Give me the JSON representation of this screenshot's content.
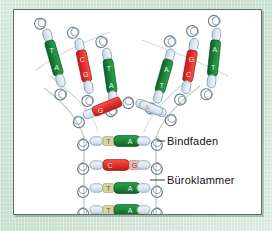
{
  "figure": {
    "panel_background": "#ffffff",
    "page_background": "#cfe3d6",
    "border_color": "#5d6f66"
  },
  "palette": {
    "base_green": "#1d8a3c",
    "base_green_dark": "#13682c",
    "base_red": "#e8322a",
    "base_red_dark": "#c2211b",
    "clip_fill": "#dbe9f2",
    "clip_stroke": "#6b7f8c",
    "string": "#b9c4bd",
    "letter_light": "#eaf4ea",
    "letter_tan": "#d8d2a0",
    "leader_line": "#3b3b3b",
    "label_text": "#111111"
  },
  "labels": [
    {
      "id": "bindfaden",
      "text": "Bindfaden",
      "x": 153,
      "y": 125
    },
    {
      "id": "bueroklammer",
      "text": "Büroklammer",
      "x": 153,
      "y": 164
    }
  ],
  "legend_leaders": [
    {
      "for": "bindfaden",
      "x1": 142,
      "y1": 131,
      "x2": 150,
      "y2": 131
    },
    {
      "for": "bueroklammer",
      "x1": 135,
      "y1": 170,
      "x2": 150,
      "y2": 170
    }
  ],
  "base_pair_letters": {
    "green_pair": [
      "T",
      "A"
    ],
    "red_pair": [
      "C",
      "G"
    ]
  },
  "ladder_rungs": [
    {
      "index": 1,
      "color": "green",
      "left_letter": "T",
      "right_letter": "A",
      "x": 70,
      "y": 131,
      "width": 72
    },
    {
      "index": 2,
      "color": "red",
      "left_letter": "C",
      "right_letter": "G",
      "x": 70,
      "y": 155,
      "width": 72
    },
    {
      "index": 3,
      "color": "green",
      "left_letter": "T",
      "right_letter": "A",
      "x": 70,
      "y": 178,
      "width": 72
    },
    {
      "index": 4,
      "color": "green",
      "left_letter": "T",
      "right_letter": "A",
      "x": 70,
      "y": 200,
      "width": 72
    }
  ],
  "fork": {
    "description": "Replikationsgabel - die Doppelhelix ist oben in zwei Einzelstraenge aufgetrennt",
    "left_strand_bases": [
      {
        "order": 1,
        "color": "green",
        "letters": [
          "T",
          "A"
        ],
        "cx": 40,
        "cy": 48,
        "angle": -14
      },
      {
        "order": 2,
        "color": "red",
        "letters": [
          "C",
          "G"
        ],
        "cx": 68,
        "cy": 55,
        "angle": -8
      },
      {
        "order": 3,
        "color": "green",
        "letters": [
          "T",
          "A"
        ],
        "cx": 93,
        "cy": 62,
        "angle": -6
      },
      {
        "order": 4,
        "color": "red",
        "letters": [
          "C",
          "G"
        ],
        "cx": 96,
        "cy": 97,
        "angle": -28
      }
    ],
    "right_strand_bases": [
      {
        "order": 1,
        "color": "green",
        "letters": [
          "A",
          "T"
        ],
        "cx": 148,
        "cy": 62,
        "angle": 14
      },
      {
        "order": 2,
        "color": "red",
        "letters": [
          "G",
          "C"
        ],
        "cx": 172,
        "cy": 55,
        "angle": 10
      },
      {
        "order": 3,
        "color": "green",
        "letters": [
          "A",
          "T"
        ],
        "cx": 198,
        "cy": 48,
        "angle": 8
      },
      {
        "order": 4,
        "color": "clip",
        "letters": [
          "A",
          "T"
        ],
        "cx": 143,
        "cy": 98,
        "angle": 18
      }
    ]
  },
  "materials": [
    {
      "name": "Büroklammer",
      "role": "Zucker-Phosphat-Verbindung / Klammer"
    },
    {
      "name": "Bindfaden",
      "role": "Strangrückgrat"
    }
  ]
}
